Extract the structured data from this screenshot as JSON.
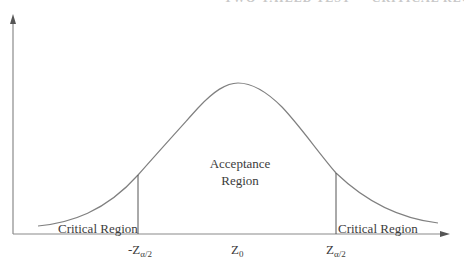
{
  "header": {
    "cropped_text": "TWO-TAILED TEST — CRITICAL REGIONS"
  },
  "diagram": {
    "type": "normal-distribution-two-tailed",
    "regions": {
      "left_critical": "Critical Region",
      "acceptance_line1": "Acceptance",
      "acceptance_line2": "Region",
      "right_critical": "Critical Region"
    },
    "axis_labels": {
      "left_critical_value": "-Z",
      "left_critical_sub": "α/2",
      "center_value": "Z",
      "center_sub": "0",
      "right_critical_value": "Z",
      "right_critical_sub": "α/2"
    },
    "colors": {
      "axis": "#666666",
      "curve": "#808080",
      "text": "#3c3c3c"
    }
  }
}
